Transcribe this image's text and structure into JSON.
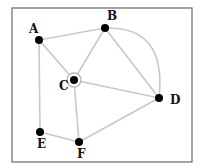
{
  "diagram": {
    "type": "graph",
    "frame": {
      "x": 12,
      "y": 8,
      "width": 180,
      "height": 154,
      "stroke": "#6a6a6a"
    },
    "colors": {
      "edge": "#c8c8c8",
      "node": "#000000",
      "ring": "#b8b8b8",
      "background": "#ffffff"
    },
    "nodes": [
      {
        "id": "A",
        "label": "A",
        "x": 39,
        "y": 40,
        "lx": 29,
        "ly": 33
      },
      {
        "id": "B",
        "label": "B",
        "x": 105,
        "y": 28,
        "lx": 107,
        "ly": 20
      },
      {
        "id": "C",
        "label": "C",
        "x": 74,
        "y": 80,
        "lx": 59,
        "ly": 90,
        "highlighted": true
      },
      {
        "id": "D",
        "label": "D",
        "x": 159,
        "y": 98,
        "lx": 170,
        "ly": 104
      },
      {
        "id": "E",
        "label": "E",
        "x": 40,
        "y": 132,
        "lx": 37,
        "ly": 148
      },
      {
        "id": "F",
        "label": "F",
        "x": 79,
        "y": 142,
        "lx": 77,
        "ly": 158
      }
    ],
    "edges": [
      {
        "from": "A",
        "to": "B"
      },
      {
        "from": "A",
        "to": "C"
      },
      {
        "from": "A",
        "to": "E"
      },
      {
        "from": "B",
        "to": "C"
      },
      {
        "from": "B",
        "to": "D"
      },
      {
        "from": "B",
        "to": "D",
        "curved": true
      },
      {
        "from": "C",
        "to": "D"
      },
      {
        "from": "C",
        "to": "F"
      },
      {
        "from": "E",
        "to": "F"
      },
      {
        "from": "F",
        "to": "D"
      }
    ]
  }
}
